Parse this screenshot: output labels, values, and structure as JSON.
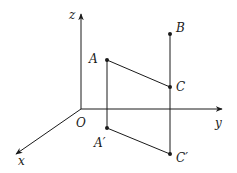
{
  "diagram": {
    "type": "3d-coordinate-projection",
    "axes": {
      "z": {
        "label": "z",
        "from": [
          81,
          109
        ],
        "to": [
          81,
          14
        ],
        "label_pos": [
          69,
          19
        ]
      },
      "y": {
        "label": "y",
        "from": [
          81,
          109
        ],
        "to": [
          222,
          109
        ],
        "label_pos": [
          215,
          127
        ]
      },
      "x": {
        "label": "x",
        "from": [
          81,
          109
        ],
        "to": [
          16,
          154
        ],
        "label_pos": [
          18,
          165
        ]
      }
    },
    "origin": {
      "label": "O",
      "pos": [
        81,
        109
      ],
      "label_pos": [
        76,
        127
      ]
    },
    "points": [
      {
        "id": "A",
        "label": "A",
        "pos": [
          107,
          60
        ],
        "label_pos": [
          89,
          63
        ]
      },
      {
        "id": "B",
        "label": "B",
        "pos": [
          170,
          34
        ],
        "label_pos": [
          176,
          32
        ]
      },
      {
        "id": "C",
        "label": "C",
        "pos": [
          170,
          87
        ],
        "label_pos": [
          176,
          91
        ]
      },
      {
        "id": "A1",
        "label": "A′",
        "pos": [
          107,
          128
        ],
        "label_pos": [
          94,
          147
        ]
      },
      {
        "id": "C1",
        "label": "C′",
        "pos": [
          170,
          154
        ],
        "label_pos": [
          176,
          162
        ]
      }
    ],
    "segments": [
      {
        "from": "A",
        "to": "C"
      },
      {
        "from": "A",
        "to": "A1"
      },
      {
        "from": "A1",
        "to": "C1"
      },
      {
        "from": "B",
        "to": "C1"
      }
    ]
  }
}
